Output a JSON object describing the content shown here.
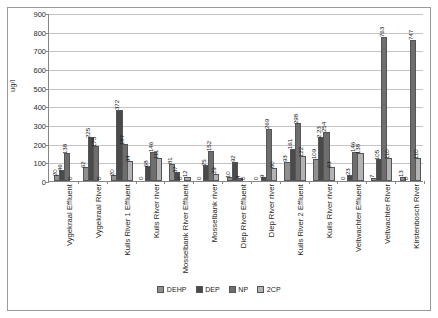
{
  "chart_data": {
    "type": "bar",
    "title": "",
    "xlabel": "",
    "ylabel": "ug/l",
    "ylim": [
      0,
      900
    ],
    "ytick_step": 100,
    "yticks": [
      0,
      100,
      200,
      300,
      400,
      500,
      600,
      700,
      800,
      900
    ],
    "grid": true,
    "legend_position": "bottom",
    "categories": [
      "Vygekraal Effluent",
      "Vygekraal River",
      "Kuils River 1 Effluent",
      "Kuils River river",
      "Mosselbank River Effluent",
      "Mosselbank river",
      "Diep River Effluent",
      "Diep River river",
      "Kuils River 2 Effluent",
      "Kuils River river",
      "Veltwachter Effluent",
      "Veltwachter River",
      "Kirstenbosch River"
    ],
    "series": [
      {
        "name": "DEHP",
        "color": "#8f8f8f",
        "values": [
          20,
          62,
          20,
          0,
          81,
          0,
          10,
          0,
          93,
          109,
          0,
          7,
          13
        ]
      },
      {
        "name": "DEP",
        "color": "#4a4a4a",
        "values": [
          46,
          225,
          372,
          68,
          37,
          75,
          92,
          9,
          161,
          223,
          23,
          105,
          0
        ]
      },
      {
        "name": "NP",
        "color": "#6e6e6e",
        "values": [
          138,
          175,
          187,
          146,
          0,
          152,
          4,
          269,
          298,
          254,
          146,
          763,
          747
        ]
      },
      {
        "name": "2CP",
        "color": "#b3b3b3",
        "values": [
          0,
          0,
          94,
          111,
          12,
          29,
          0,
          60,
          122,
          63,
          138,
          110,
          110
        ]
      }
    ],
    "bar_labels": [
      [
        "20",
        "46",
        "138",
        "0"
      ],
      [
        "62",
        "225",
        "175",
        "0"
      ],
      [
        "20",
        "372",
        "187",
        "94"
      ],
      [
        "0",
        "68",
        "146",
        "111"
      ],
      [
        "81",
        "37",
        "0",
        "12"
      ],
      [
        "0",
        "75",
        "152",
        "29"
      ],
      [
        "10",
        "92",
        "4",
        "0"
      ],
      [
        "0",
        "9",
        "269",
        "60"
      ],
      [
        "93",
        "161",
        "298",
        "122"
      ],
      [
        "109",
        "2.23",
        "254",
        "63"
      ],
      [
        "0",
        "23",
        "146",
        "138"
      ],
      [
        "7",
        "105",
        "763",
        "110"
      ],
      [
        "13",
        "0",
        "747",
        "110"
      ]
    ]
  },
  "legend": {
    "items": [
      {
        "label": "DEHP",
        "color": "#8f8f8f"
      },
      {
        "label": "DEP",
        "color": "#4a4a4a"
      },
      {
        "label": "NP",
        "color": "#6e6e6e"
      },
      {
        "label": "2CP",
        "color": "#b3b3b3"
      }
    ]
  }
}
